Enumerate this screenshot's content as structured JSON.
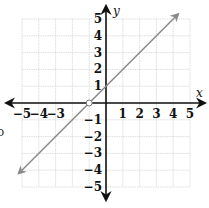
{
  "chart_data": {
    "type": "line",
    "title": "",
    "xlabel": "x",
    "ylabel": "y",
    "xlim": [
      -5,
      5
    ],
    "ylim": [
      -5,
      5
    ],
    "grid": true,
    "x_ticks": [
      "−5",
      "−4",
      "−3",
      "1",
      "2",
      "3",
      "4",
      "5"
    ],
    "y_ticks": [
      "5",
      "4",
      "3",
      "2",
      "1",
      "−1",
      "−2",
      "−3",
      "−4",
      "−5"
    ],
    "series": [
      {
        "name": "y = x + 1",
        "equation": "y = x + 1",
        "slope": 1,
        "intercept": 1,
        "x": [
          -5.2,
          4.3
        ],
        "y": [
          -4.2,
          5.3
        ],
        "arrows_both_ends": true,
        "color": "#8a8a8a"
      }
    ],
    "annotations": [
      {
        "type": "open-circle",
        "x": -1,
        "y": 0
      }
    ]
  },
  "edge_glyph": "o",
  "colors": {
    "axis": "#111111",
    "grid": "#d6d6d6",
    "line": "#8a8a8a"
  }
}
